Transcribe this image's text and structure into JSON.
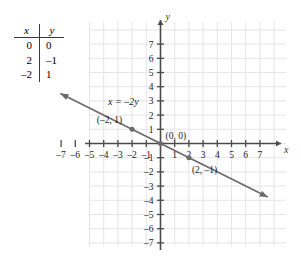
{
  "figure": {
    "kind": "coordinate-plane-line-graph"
  },
  "table": {
    "headers": [
      "x",
      "y"
    ],
    "rows": [
      {
        "x": "0",
        "y": "0"
      },
      {
        "x": "2",
        "y": "–1"
      },
      {
        "x": "–2",
        "y": "1"
      }
    ]
  },
  "chart_data": {
    "type": "line",
    "title": "",
    "xlabel": "x",
    "ylabel": "y",
    "equation": "x = –2y",
    "equation_label": "x = –2y",
    "slope": -0.5,
    "intercept": 0,
    "xlim": [
      -7.5,
      7.5
    ],
    "ylim": [
      -7.5,
      7.5
    ],
    "grid": true,
    "x_ticks": [
      -7,
      -6,
      -5,
      -4,
      -3,
      -2,
      -1,
      1,
      2,
      3,
      4,
      5,
      6,
      7
    ],
    "y_ticks": [
      -7,
      -6,
      -5,
      -4,
      -3,
      -2,
      -1,
      1,
      2,
      3,
      4,
      5,
      6,
      7
    ],
    "x_tick_labels": [
      "–7",
      "–6",
      "–5",
      "–4",
      "–3",
      "–2",
      "–1",
      "1",
      "2",
      "3",
      "4",
      "5",
      "6",
      "7"
    ],
    "y_tick_labels": [
      "–7",
      "–6",
      "–5",
      "–4",
      "–3",
      "–2",
      "–1",
      "1",
      "2",
      "3",
      "4",
      "5",
      "6",
      "7"
    ],
    "points": [
      {
        "x": -2,
        "y": 1,
        "label": "(–2, 1)"
      },
      {
        "x": 0,
        "y": 0,
        "label": "(0, 0)"
      },
      {
        "x": 2,
        "y": -1,
        "label": "(2, –1)"
      }
    ],
    "line_color": "#6b6b6b",
    "grid_color": "#e4e4ea",
    "axis_color": "#4a4a4a",
    "arrows": [
      "left",
      "right"
    ]
  },
  "labels": {
    "y_axis": "y",
    "x_axis": "x",
    "equation": "x = –2y",
    "point_origin": "(0, 0)",
    "point_left": "(–2, 1)",
    "point_right": "(2, –1)"
  }
}
